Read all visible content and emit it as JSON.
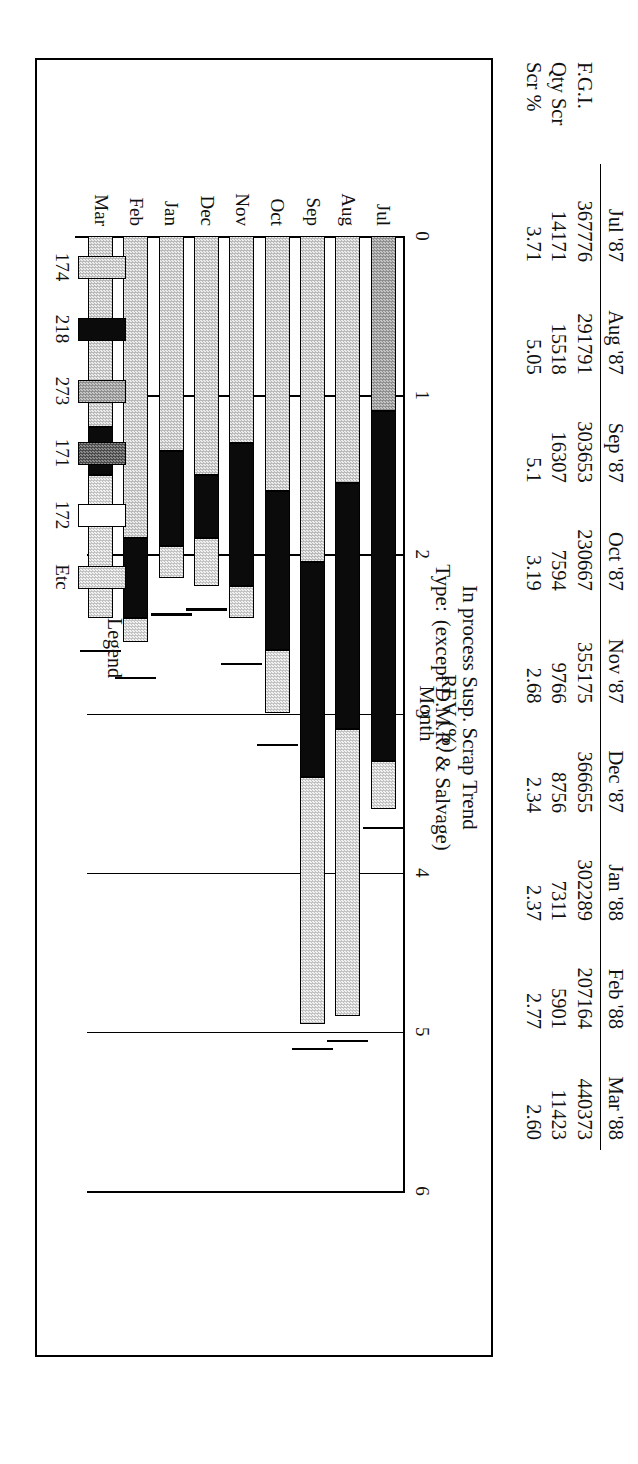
{
  "document": {
    "chart_title_line1": "In process Susp. Scrap Trend",
    "type_label": "Type:",
    "type_value": "(except D.M.R. & Salvage)"
  },
  "table": {
    "columns": [
      "",
      "Jul '87",
      "Aug '87",
      "Sep '87",
      "Oct '87",
      "Nov '87",
      "Dec '87",
      "Jan '88",
      "Feb '88",
      "Mar '88"
    ],
    "rows": [
      {
        "label": "F.G.I.",
        "values": [
          "367776",
          "291791",
          "303653",
          "230667",
          "355175",
          "366655",
          "302289",
          "207164",
          "440373"
        ]
      },
      {
        "label": "Qty Scr",
        "values": [
          "14171",
          "15518",
          "16307",
          "7594",
          "9766",
          "8756",
          "7311",
          "5901",
          "11423"
        ]
      },
      {
        "label": "Scr %",
        "values": [
          "3.71",
          "5.05",
          "5.1",
          "3.19",
          "2.68",
          "2.34",
          "2.37",
          "2.77",
          "2.60"
        ]
      }
    ]
  },
  "legend": {
    "title": "Legend",
    "items": [
      {
        "label": "174",
        "fill": "f-174"
      },
      {
        "label": "218",
        "fill": "f-218"
      },
      {
        "label": "273",
        "fill": "f-273"
      },
      {
        "label": "171",
        "fill": "f-171"
      },
      {
        "label": "172",
        "fill": "f-172"
      },
      {
        "label": "Etc",
        "fill": "f-Etc"
      }
    ]
  },
  "chart_data": {
    "type": "bar",
    "orientation": "horizontal-stacked",
    "title": "In process Susp. Scrap Trend",
    "xlabel": "Month",
    "ylabel": "REV (%)",
    "ylim": [
      0,
      6
    ],
    "ticks": [
      "0",
      "1",
      "2",
      "3",
      "4",
      "5",
      "6"
    ],
    "grid": true,
    "legend_position": "bottom",
    "categories": [
      "Jul",
      "Aug",
      "Sep",
      "Oct",
      "Nov",
      "Dec",
      "Jan",
      "Feb",
      "Mar"
    ],
    "series": [
      {
        "name": "174",
        "fill": "f-174",
        "values": [
          0,
          1.55,
          2.05,
          1.6,
          1.3,
          1.5,
          1.35,
          1.9,
          1.2
        ]
      },
      {
        "name": "273",
        "fill": "f-273",
        "values": [
          1.1,
          0,
          0,
          0,
          0,
          0,
          0,
          0,
          0
        ]
      },
      {
        "name": "218",
        "fill": "f-218",
        "values": [
          2.2,
          1.55,
          1.35,
          1.0,
          0.9,
          0.4,
          0.6,
          0.5,
          0.3
        ]
      },
      {
        "name": "Etc",
        "fill": "f-Etc",
        "values": [
          0.3,
          1.8,
          1.55,
          0.4,
          0.2,
          0.3,
          0.2,
          0.15,
          0.9
        ]
      }
    ],
    "totals": [
      3.6,
      4.9,
      4.95,
      3.0,
      2.4,
      2.2,
      2.15,
      2.55,
      2.4
    ],
    "trend_markers": [
      3.71,
      5.05,
      5.1,
      3.19,
      2.68,
      2.34,
      2.37,
      2.77,
      2.6
    ]
  }
}
